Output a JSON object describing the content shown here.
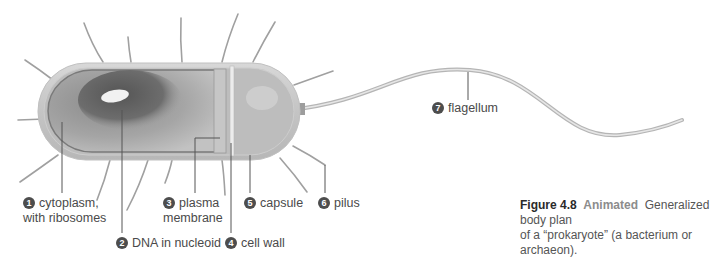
{
  "figure": {
    "number_label": "Figure 4.8",
    "tag": "Animated",
    "caption_line1": "Generalized body plan",
    "caption_line2": "of a “prokaryote” (a bacterium or archaeon)."
  },
  "labels": [
    {
      "num": "1",
      "line1": "cytoplasm,",
      "line2": "with ribosomes"
    },
    {
      "num": "2",
      "line1": "DNA in nucleoid"
    },
    {
      "num": "3",
      "line1": "plasma",
      "line2": "membrane"
    },
    {
      "num": "4",
      "line1": "cell wall"
    },
    {
      "num": "5",
      "line1": "capsule"
    },
    {
      "num": "6",
      "line1": "pilus"
    },
    {
      "num": "7",
      "line1": "flagellum"
    }
  ],
  "colors": {
    "pili": "#9a9a9a",
    "capsule": "#cfcfcf",
    "cytoplasm": "#a9a9a9",
    "nucleoid": "#5e5e5e",
    "badge": "#4d4d4d",
    "leader_lines": "#555555"
  }
}
